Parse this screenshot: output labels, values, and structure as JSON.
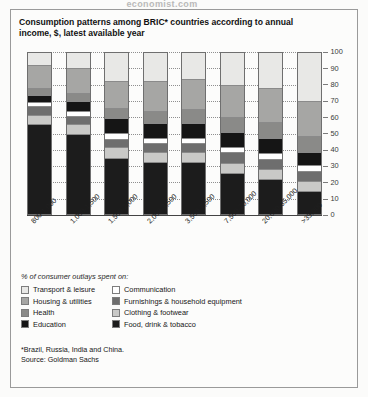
{
  "top_partial_text": "economist.com",
  "title": "Consumption patterns among BRIC* countries according to annual income, $, latest available year",
  "legend": {
    "caption": "% of consumer outlays spent on:",
    "items": [
      {
        "label": "Transport & leisure",
        "color": "#e8e8e6",
        "col": 0,
        "row": 0
      },
      {
        "label": "Communication",
        "color": "#ffffff",
        "col": 1,
        "row": 0
      },
      {
        "label": "Housing & utilities",
        "color": "#a6a6a4",
        "col": 0,
        "row": 1
      },
      {
        "label": "Furnishings & household equipment",
        "color": "#6e6e6e",
        "col": 1,
        "row": 1
      },
      {
        "label": "Health",
        "color": "#8a8a88",
        "col": 0,
        "row": 2
      },
      {
        "label": "Clothing & footwear",
        "color": "#c9c9c7",
        "col": 1,
        "row": 2
      },
      {
        "label": "Education",
        "color": "#151515",
        "col": 0,
        "row": 3
      },
      {
        "label": "Food, drink & tobacco",
        "color": "#1c1c1c",
        "col": 1,
        "row": 3
      }
    ]
  },
  "footnote": "*Brazil, Russia, India and China.",
  "source": "Source: Goldman Sachs",
  "chart_data": {
    "type": "bar",
    "title": "Consumption patterns among BRIC* countries according to annual income, $, latest available year",
    "subtype": "stacked-100",
    "xlabel": "",
    "ylabel": "",
    "ylim": [
      0,
      100
    ],
    "yticks": [
      0,
      10,
      20,
      30,
      40,
      50,
      60,
      70,
      80,
      90,
      100
    ],
    "grid": true,
    "legend_position": "below",
    "categories": [
      "800-1,000",
      "1,000-1,500",
      "1,500-2,000",
      "2,000-3,500",
      "3,500-7,500",
      "7,500-20,000",
      "20,000-35,000",
      ">35,000"
    ],
    "series": [
      {
        "name": "Food, drink & tobacco",
        "color": "#1c1c1c",
        "values": [
          58,
          51,
          36,
          33,
          33,
          26,
          22,
          14
        ]
      },
      {
        "name": "Clothing & footwear",
        "color": "#c9c9c7",
        "values": [
          5,
          6,
          6,
          6,
          6,
          6,
          6,
          6
        ]
      },
      {
        "name": "Furnishings & household equipment",
        "color": "#6e6e6e",
        "values": [
          5,
          5,
          5,
          5,
          5,
          6,
          6,
          6
        ]
      },
      {
        "name": "Communication",
        "color": "#ffffff",
        "values": [
          2,
          2,
          3,
          3,
          3,
          3,
          3,
          3
        ]
      },
      {
        "name": "Education",
        "color": "#151515",
        "values": [
          4,
          6,
          9,
          9,
          9,
          9,
          9,
          8
        ]
      },
      {
        "name": "Health",
        "color": "#8a8a88",
        "values": [
          4,
          5,
          6,
          7,
          8,
          9,
          10,
          10
        ]
      },
      {
        "name": "Housing & utilities",
        "color": "#a6a6a4",
        "values": [
          14,
          15,
          17,
          19,
          19,
          20,
          21,
          22
        ]
      },
      {
        "name": "Transport & leisure",
        "color": "#e8e8e6",
        "values": [
          8,
          10,
          18,
          18,
          17,
          21,
          23,
          31
        ]
      }
    ]
  }
}
